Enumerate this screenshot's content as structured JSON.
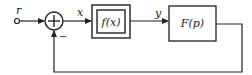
{
  "diagram": {
    "type": "feedback-control-block-diagram",
    "signals": {
      "input": "r",
      "error": "x",
      "intermediate": "y"
    },
    "summing_junction": {
      "symbol": "+",
      "feedback_sign": "−"
    },
    "blocks": [
      {
        "id": "nonlinear",
        "label": "f(x)",
        "style": "double-border"
      },
      {
        "id": "linear",
        "label": "F(p)",
        "style": "single-border"
      }
    ],
    "colors": {
      "stroke": "#222222",
      "background": "#ffffff"
    }
  }
}
